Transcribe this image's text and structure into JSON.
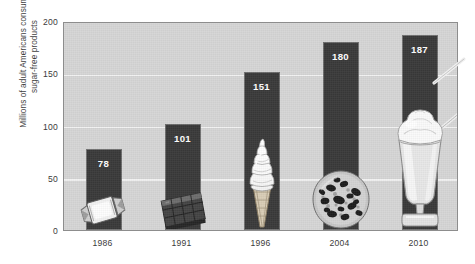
{
  "chart_data": {
    "type": "bar",
    "title": "",
    "xlabel": "",
    "ylabel": "Millions of adult Americans consuming sugar-free products",
    "ylabel_lines": [
      "Millions of adult Americans consuming",
      "sugar-free products"
    ],
    "categories": [
      "1986",
      "1991",
      "1996",
      "2004",
      "2010"
    ],
    "values": [
      78,
      101,
      151,
      180,
      187
    ],
    "ylim": [
      0,
      200
    ],
    "yticks": [
      0,
      50,
      100,
      150,
      200
    ],
    "ytick_labels": [
      "0",
      "50",
      "100",
      "150",
      "200"
    ],
    "gridlines": true,
    "legend": "none",
    "series": [
      {
        "name": "Millions of adult Americans consuming sugar-free products",
        "values": [
          78,
          101,
          151,
          180,
          187
        ]
      }
    ],
    "bar_images": [
      "wrapped-candy",
      "chocolate-bar",
      "soft-serve-ice-cream-cone",
      "chocolate-chip-cookie",
      "milkshake-glass"
    ]
  },
  "colors": {
    "bar": "#3a3a3a",
    "plot_background": "#d6d6d6",
    "gridline": "#f2f2f2",
    "page_background": "#ffffff",
    "axis_border": "#8d8d8d",
    "text": "#3b3b3b",
    "value_label": "#ffffff"
  }
}
